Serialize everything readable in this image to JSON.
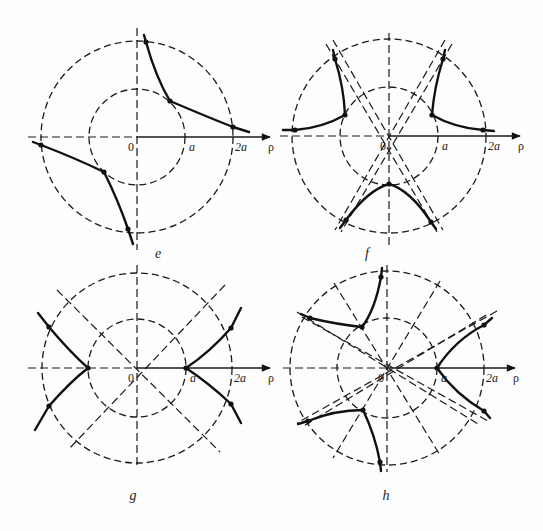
{
  "figure": {
    "panels": [
      {
        "id": "e",
        "caption": "e",
        "caption_pos": [
          158,
          258
        ],
        "center": [
          137,
          137
        ],
        "r_inner": 48,
        "r_outer": 96,
        "labels": {
          "origin": "0",
          "inner": "a",
          "outer": "2a",
          "axis": "ρ"
        },
        "dashed_lines": [
          [
            137,
            28,
            137,
            250
          ],
          [
            28,
            137,
            137,
            137
          ]
        ],
        "axis_arrow_end": 270,
        "curves": [
          "M144,35 L146,42 Q156,78 170,101 Q205,116 233,127 L249,132",
          "M33,142 L41,145 Q75,158 104,172 Q118,200 128,229 L133,244"
        ],
        "dots": [
          [
            146,
            42
          ],
          [
            170,
            101
          ],
          [
            233,
            127
          ],
          [
            41,
            145
          ],
          [
            104,
            172
          ],
          [
            128,
            229
          ]
        ]
      },
      {
        "id": "f",
        "caption": "f",
        "caption_pos": [
          367,
          258
        ],
        "center": [
          389,
          136
        ],
        "r_inner": 49,
        "r_outer": 97,
        "labels": {
          "origin": "0",
          "inner": "a",
          "outer": "2a",
          "axis": "ρ"
        },
        "dashed_lines": [
          [
            389,
            33,
            389,
            245
          ],
          [
            280,
            136,
            389,
            136
          ],
          [
            333,
            40,
            443,
            230
          ],
          [
            445,
            40,
            335,
            230
          ],
          [
            326,
            44,
            437,
            232
          ],
          [
            452,
            44,
            341,
            232
          ]
        ],
        "axis_arrow_end": 520,
        "curves": [
          "M333,50 L335,59 Q344,88 345,115 Q322,128 295,130 L283,130",
          "M445,50 L443,59 Q434,88 432,115 Q455,128 483,130 L494,131",
          "M340,228 L346,220 Q368,190 389,184 Q410,190 431,222 L436,229"
        ],
        "dots": [
          [
            335,
            59
          ],
          [
            345,
            115
          ],
          [
            295,
            130
          ],
          [
            443,
            59
          ],
          [
            432,
            115
          ],
          [
            483,
            130
          ],
          [
            389,
            184
          ],
          [
            346,
            220
          ],
          [
            431,
            222
          ]
        ]
      },
      {
        "id": "g",
        "caption": "g",
        "caption_pos": [
          133,
          500
        ],
        "center": [
          137,
          368
        ],
        "r_inner": 49,
        "r_outer": 95,
        "labels": {
          "origin": "0",
          "inner": "a",
          "outer": "2a",
          "axis": "ρ"
        },
        "dashed_lines": [
          [
            137,
            265,
            137,
            468
          ],
          [
            28,
            368,
            137,
            368
          ],
          [
            57,
            290,
            220,
            452
          ],
          [
            225,
            285,
            68,
            450
          ]
        ],
        "axis_arrow_end": 270,
        "curves": [
          "M38,313 L49,327 Q70,352 88,368 Q70,382 49,406 L35,430",
          "M241,308 L231,328 Q210,352 186,368 Q210,384 231,404 L241,423"
        ],
        "dots": [
          [
            49,
            327
          ],
          [
            88,
            368
          ],
          [
            49,
            406
          ],
          [
            231,
            328
          ],
          [
            186,
            368
          ],
          [
            231,
            404
          ]
        ]
      },
      {
        "id": "h",
        "caption": "h",
        "caption_pos": [
          386,
          500
        ],
        "center": [
          387,
          368
        ],
        "r_inner": 50,
        "r_outer": 97,
        "labels": {
          "origin": "0",
          "inner": "a",
          "outer": "2a",
          "axis": "ρ"
        },
        "dashed_lines": [
          [
            387,
            265,
            387,
            472
          ],
          [
            283,
            368,
            387,
            368
          ],
          [
            334,
            283,
            440,
            455
          ],
          [
            440,
            281,
            333,
            458
          ],
          [
            297,
            312,
            478,
            424
          ],
          [
            497,
            311,
            297,
            423
          ],
          [
            302,
            317,
            488,
            421
          ],
          [
            486,
            315,
            302,
            427
          ]
        ],
        "axis_arrow_end": 515,
        "curves": [
          "M382,268 L381,277 Q375,310 362,327 Q335,324 310,318 L301,314",
          "M298,424 L308,421 Q335,410 363,410 Q375,435 380,462 L381,471",
          "M492,318 L484,325 Q455,340 437,368 Q455,394 484,411 L490,418"
        ],
        "dots": [
          [
            381,
            277
          ],
          [
            362,
            327
          ],
          [
            310,
            318
          ],
          [
            308,
            421
          ],
          [
            363,
            410
          ],
          [
            380,
            462
          ],
          [
            484,
            325
          ],
          [
            437,
            368
          ],
          [
            484,
            411
          ]
        ]
      }
    ]
  }
}
